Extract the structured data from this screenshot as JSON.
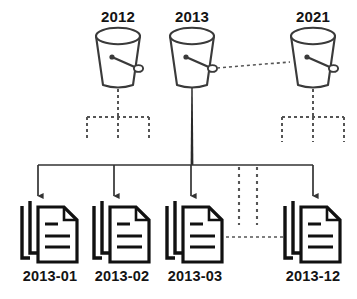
{
  "diagram": {
    "colors": {
      "stroke": "#333333",
      "bucket_stroke": "#3a3a3a",
      "doc_stroke": "#111111",
      "text": "#141414",
      "dashed": "#555555",
      "background": "#ffffff"
    },
    "buckets": [
      {
        "id": "bucket-2012",
        "label": "2012",
        "cx": 118,
        "cy": 62,
        "icon": "bucket-icon",
        "has_handle": true,
        "child_tree": "dashed"
      },
      {
        "id": "bucket-2013",
        "label": "2013",
        "cx": 192,
        "cy": 62,
        "icon": "bucket-icon",
        "has_handle": true,
        "child_tree": "solid"
      },
      {
        "id": "bucket-2021",
        "label": "2021",
        "cx": 313,
        "cy": 62,
        "icon": "bucket-icon",
        "has_handle": true,
        "child_tree": "dashed"
      }
    ],
    "documents": [
      {
        "id": "doc-2013-01",
        "label": "2013-01",
        "cx": 50,
        "icon": "document-stack-icon"
      },
      {
        "id": "doc-2013-02",
        "label": "2013-02",
        "cx": 122,
        "icon": "document-stack-icon"
      },
      {
        "id": "doc-2013-03",
        "label": "2013-03",
        "cx": 195,
        "icon": "document-stack-icon"
      },
      {
        "id": "doc-2013-12",
        "label": "2013-12",
        "cx": 313,
        "icon": "document-stack-icon"
      }
    ],
    "connectors": [
      {
        "id": "bucket-link-2013-2021",
        "style": "dotted",
        "orientation": "horizontal",
        "from": "bucket-2013",
        "to": "bucket-2021"
      },
      {
        "id": "doc-link-03-12",
        "style": "dotted",
        "orientation": "horizontal",
        "from": "doc-2013-03",
        "to": "doc-2013-12"
      },
      {
        "id": "trunk-2013",
        "style": "solid-thick",
        "orientation": "vertical",
        "from": "bucket-2013",
        "to": "fanout-bar"
      },
      {
        "id": "fanout-bar",
        "style": "solid",
        "orientation": "horizontal"
      },
      {
        "id": "ellipsis-stub-left",
        "style": "dotted",
        "orientation": "vertical"
      },
      {
        "id": "ellipsis-stub-right",
        "style": "dotted",
        "orientation": "vertical"
      }
    ]
  }
}
